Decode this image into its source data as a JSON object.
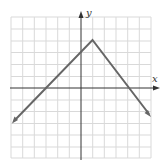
{
  "figure": {
    "header_label": "",
    "x_axis_label": "x",
    "y_axis_label": "y",
    "grid_color": "#d9d9d9",
    "axis_color": "#333333",
    "line_color": "#666666"
  },
  "graph": {
    "type": "piecewise-linear",
    "description": "Inverted V-shaped graph with vertex at (1, 4), crossing x-axis near -3 and 4",
    "vertex": [
      1,
      4
    ],
    "x_intercepts": [
      -3,
      4
    ],
    "grid": {
      "x_range": [
        -6,
        6
      ],
      "y_range": [
        -6,
        6
      ]
    }
  }
}
